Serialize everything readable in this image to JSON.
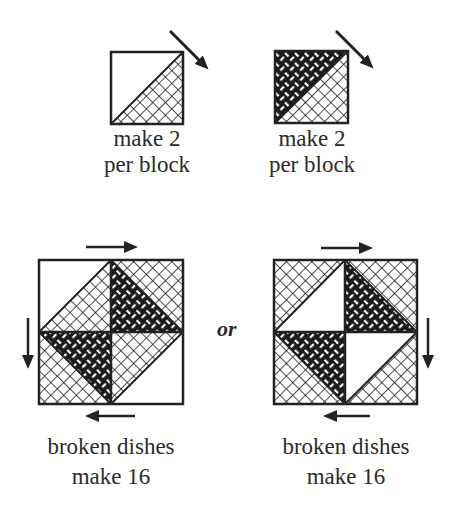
{
  "top_units": [
    {
      "label_line1": "make 2",
      "label_line2": "per block",
      "fabrics": [
        "white",
        "crosshatch"
      ]
    },
    {
      "label_line1": "make 2",
      "label_line2": "per block",
      "fabrics": [
        "weave",
        "crosshatch"
      ]
    }
  ],
  "connector": "or",
  "blocks": [
    {
      "label_line1": "broken dishes",
      "label_line2": "make 16",
      "rotation_arrows": [
        "right",
        "down",
        "left"
      ]
    },
    {
      "label_line1": "broken dishes",
      "label_line2": "make 16",
      "rotation_arrows": [
        "right",
        "down",
        "left"
      ]
    }
  ],
  "colors": {
    "line": "#222222",
    "background": "#ffffff"
  }
}
